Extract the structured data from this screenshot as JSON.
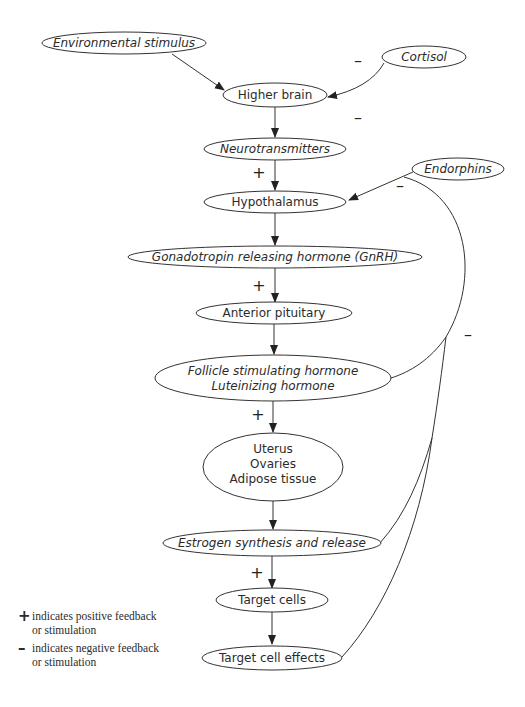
{
  "nodes": {
    "environmental_stimulus": {
      "label": "Environmental stimulus",
      "italic": true
    },
    "cortisol": {
      "label": "Cortisol",
      "italic": true
    },
    "higher_brain": {
      "label": "Higher brain",
      "italic": false
    },
    "neurotransmitters": {
      "label": "Neurotransmitters",
      "italic": true
    },
    "endorphins": {
      "label": "Endorphins",
      "italic": true
    },
    "hypothalamus": {
      "label": "Hypothalamus",
      "italic": false
    },
    "gnrh": {
      "label": "Gonadotropin releasing hormone (GnRH)",
      "italic": true
    },
    "anterior_pituitary": {
      "label": "Anterior pituitary",
      "italic": false
    },
    "fsh_lh": {
      "line1": "Follicle stimulating hormone",
      "line2": "Luteinizing hormone",
      "italic": true
    },
    "tissues": {
      "line1": "Uterus",
      "line2": "Ovaries",
      "line3": "Adipose tissue",
      "italic": false
    },
    "estrogen": {
      "label": "Estrogen synthesis and release",
      "italic": true
    },
    "target_cells": {
      "label": "Target cells",
      "italic": false
    },
    "target_cell_effects": {
      "label": "Target cell effects",
      "italic": false
    }
  },
  "signs": {
    "plus": "+",
    "minus": "–"
  },
  "edges": [
    {
      "from": "Environmental stimulus",
      "to": "Higher brain",
      "sign": ""
    },
    {
      "from": "Cortisol",
      "to": "Higher brain",
      "sign": "-"
    },
    {
      "from": "Higher brain",
      "to": "Neurotransmitters",
      "sign": "-"
    },
    {
      "from": "Neurotransmitters",
      "to": "Hypothalamus",
      "sign": "+"
    },
    {
      "from": "Endorphins",
      "to": "Hypothalamus",
      "sign": "-"
    },
    {
      "from": "Hypothalamus",
      "to": "Gonadotropin releasing hormone (GnRH)",
      "sign": ""
    },
    {
      "from": "Gonadotropin releasing hormone (GnRH)",
      "to": "Anterior pituitary",
      "sign": "+"
    },
    {
      "from": "Anterior pituitary",
      "to": "Follicle stimulating hormone / Luteinizing hormone",
      "sign": ""
    },
    {
      "from": "Follicle stimulating hormone / Luteinizing hormone",
      "to": "Uterus / Ovaries / Adipose tissue",
      "sign": "+"
    },
    {
      "from": "Uterus / Ovaries / Adipose tissue",
      "to": "Estrogen synthesis and release",
      "sign": ""
    },
    {
      "from": "Estrogen synthesis and release",
      "to": "Target cells",
      "sign": "+"
    },
    {
      "from": "Target cells",
      "to": "Target cell effects",
      "sign": ""
    },
    {
      "from": "Follicle stimulating hormone / Luteinizing hormone",
      "to": "Endorphins (feedback)",
      "sign": "-"
    },
    {
      "from": "Estrogen synthesis and release",
      "to": "feedback loop",
      "sign": "-"
    },
    {
      "from": "Target cell effects",
      "to": "feedback loop",
      "sign": "-"
    }
  ],
  "legend": {
    "positive": {
      "symbol": "+",
      "line1": "indicates positive feedback",
      "line2": "or stimulation"
    },
    "negative": {
      "symbol": "–",
      "line1": "indicates negative feedback",
      "line2": "or stimulation"
    }
  },
  "colors": {
    "stroke": "#333333",
    "text": "#2b2b2b",
    "background": "#ffffff"
  }
}
